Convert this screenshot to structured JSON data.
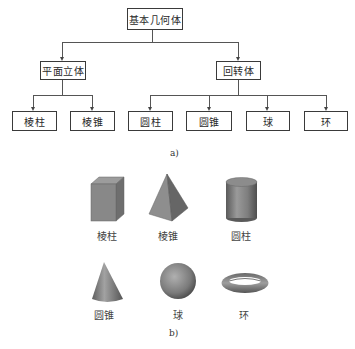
{
  "diagram_a": {
    "root": "基本几何体",
    "level2": [
      {
        "label": "平面立体",
        "children": [
          "棱柱",
          "棱锥"
        ]
      },
      {
        "label": "回转体",
        "children": [
          "圆柱",
          "圆锥",
          "球",
          "环"
        ]
      }
    ],
    "caption": "a)"
  },
  "diagram_b": {
    "shapes": [
      {
        "name": "prism",
        "label": "棱柱"
      },
      {
        "name": "pyramid",
        "label": "棱锥"
      },
      {
        "name": "cylinder",
        "label": "圆柱"
      },
      {
        "name": "cone",
        "label": "圆锥"
      },
      {
        "name": "sphere",
        "label": "球"
      },
      {
        "name": "torus",
        "label": "环"
      }
    ],
    "caption": "b)"
  },
  "colors": {
    "line": "#555555",
    "box_border": "#3a3a3a",
    "shape_fill": "#8c8c8c"
  }
}
